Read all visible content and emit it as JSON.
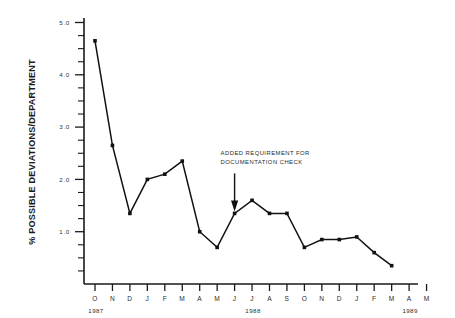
{
  "chart_data": {
    "type": "line",
    "title": "",
    "xlabel": "",
    "ylabel": "% POSSIBLE DEVIATIONS/DEPARTMENT",
    "ylim": [
      0,
      5.0
    ],
    "grid": false,
    "legend": "none",
    "y_ticks_major": [
      "1.0",
      "2.0",
      "3.0",
      "4.0",
      "5.0"
    ],
    "y_tick_values": [
      1.0,
      2.0,
      3.0,
      4.0,
      5.0
    ],
    "y_minor_step": 0.25,
    "categories": [
      "O",
      "N",
      "D",
      "J",
      "F",
      "M",
      "A",
      "M",
      "J",
      "J",
      "A",
      "S",
      "O",
      "N",
      "D",
      "J",
      "F",
      "M",
      "A",
      "M"
    ],
    "x_axis_months": [
      {
        "label": "O",
        "year": "1987"
      },
      {
        "label": "N",
        "year": ""
      },
      {
        "label": "D",
        "year": ""
      },
      {
        "label": "J",
        "year": "1988"
      },
      {
        "label": "F",
        "year": ""
      },
      {
        "label": "M",
        "year": ""
      },
      {
        "label": "A",
        "year": ""
      },
      {
        "label": "M",
        "year": ""
      },
      {
        "label": "J",
        "year": ""
      },
      {
        "label": "J",
        "year": ""
      },
      {
        "label": "A",
        "year": ""
      },
      {
        "label": "S",
        "year": ""
      },
      {
        "label": "O",
        "year": ""
      },
      {
        "label": "N",
        "year": ""
      },
      {
        "label": "D",
        "year": ""
      },
      {
        "label": "J",
        "year": "1989"
      },
      {
        "label": "F",
        "year": ""
      },
      {
        "label": "M",
        "year": ""
      },
      {
        "label": "A",
        "year": ""
      },
      {
        "label": "M",
        "year": ""
      }
    ],
    "year_labels": [
      {
        "text": "1987",
        "at_index": 0
      },
      {
        "text": "1988",
        "at_index": 9
      },
      {
        "text": "1989",
        "at_index": 18
      }
    ],
    "values": [
      4.65,
      2.65,
      1.35,
      2.0,
      2.1,
      2.35,
      1.0,
      0.7,
      1.35,
      1.6,
      1.35,
      1.35,
      0.7,
      0.85,
      0.85,
      0.9,
      0.6,
      0.35,
      null,
      null
    ],
    "series": [
      {
        "name": "% Possible Deviations/Department",
        "points": [
          {
            "x": "O",
            "year": "1987",
            "y": 4.65
          },
          {
            "x": "N",
            "year": "1987",
            "y": 2.65
          },
          {
            "x": "D",
            "year": "1987",
            "y": 1.35
          },
          {
            "x": "J",
            "year": "1988",
            "y": 2.0
          },
          {
            "x": "F",
            "year": "1988",
            "y": 2.1
          },
          {
            "x": "M",
            "year": "1988",
            "y": 2.35
          },
          {
            "x": "A",
            "year": "1988",
            "y": 1.0
          },
          {
            "x": "M",
            "year": "1988",
            "y": 0.7
          },
          {
            "x": "J",
            "year": "1988",
            "y": 1.35
          },
          {
            "x": "J",
            "year": "1988",
            "y": 1.6
          },
          {
            "x": "A",
            "year": "1988",
            "y": 1.35
          },
          {
            "x": "S",
            "year": "1988",
            "y": 1.35
          },
          {
            "x": "O",
            "year": "1988",
            "y": 0.7
          },
          {
            "x": "N",
            "year": "1988",
            "y": 0.85
          },
          {
            "x": "D",
            "year": "1988",
            "y": 0.85
          },
          {
            "x": "J",
            "year": "1989",
            "y": 0.9
          },
          {
            "x": "F",
            "year": "1989",
            "y": 0.6
          },
          {
            "x": "M",
            "year": "1989",
            "y": 0.35
          }
        ]
      }
    ],
    "annotations": [
      {
        "name": "added-requirement",
        "line1": "ADDED REQUIREMENT FOR",
        "line2": "DOCUMENTATION CHECK",
        "points_to_index": 8,
        "points_to_value": 1.35
      }
    ]
  }
}
